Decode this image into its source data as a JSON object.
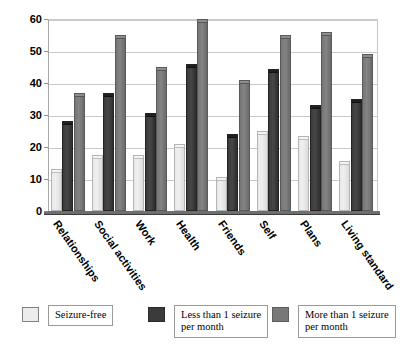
{
  "chart_data": {
    "type": "bar",
    "title": "",
    "subtitle": "",
    "xlabel": "",
    "ylabel": "",
    "ylim": [
      0,
      60
    ],
    "yticks": [
      0,
      10,
      20,
      30,
      40,
      50,
      60
    ],
    "ytick_labels": [
      "0",
      "10",
      "20",
      "30",
      "40",
      "50",
      "60"
    ],
    "grid": true,
    "legend_position": "bottom",
    "categories": [
      "Relationships",
      "Social activities",
      "Work",
      "Health",
      "Friends",
      "Self",
      "Plans",
      "Living standard"
    ],
    "series": [
      {
        "name": "Seizure-free",
        "color": "#ececec",
        "values": [
          13,
          17.5,
          17.5,
          21,
          10.5,
          25,
          23.5,
          15.5
        ]
      },
      {
        "name": "Less than 1 seizure per month",
        "color": "#3b3b3b",
        "values": [
          28,
          37,
          30.5,
          46,
          24,
          44.5,
          33,
          35
        ]
      },
      {
        "name": "More than 1 seizure per month",
        "color": "#787878",
        "values": [
          37,
          55,
          45,
          60,
          41,
          55,
          56,
          49
        ]
      }
    ],
    "legend": [
      {
        "label": "Seizure-free",
        "lines": [
          "Seizure-free"
        ],
        "color": "#ececec"
      },
      {
        "label": "Less than 1 seizure per month",
        "lines": [
          "Less than 1 seizure",
          "per month"
        ],
        "color": "#3b3b3b"
      },
      {
        "label": "More than 1 seizure per month",
        "lines": [
          "More than 1 seizure",
          "per month"
        ],
        "color": "#787878"
      }
    ]
  }
}
